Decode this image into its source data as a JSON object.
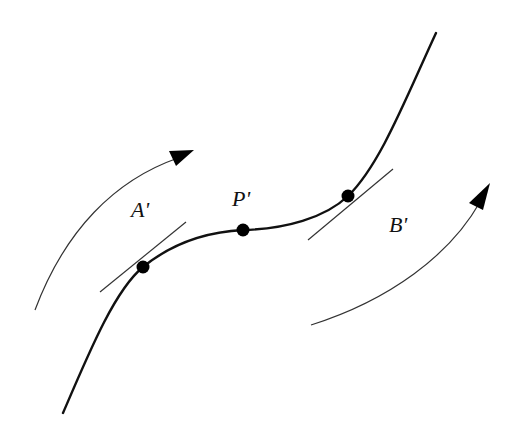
{
  "diagram": {
    "type": "curve-with-tangents",
    "colors": {
      "background": "#ffffff",
      "curve": "#111111",
      "tangent": "#333333",
      "arc": "#333333",
      "point": "#000000"
    },
    "points": [
      {
        "id": "A",
        "label": "A'",
        "x": 143,
        "y": 267
      },
      {
        "id": "P",
        "label": "P'",
        "x": 243,
        "y": 230
      },
      {
        "id": "B",
        "label": "B'",
        "x": 348,
        "y": 196
      }
    ],
    "labels": {
      "a": "A'",
      "p": "P'",
      "b": "B'"
    },
    "tangents": [
      {
        "at": "A'",
        "from": [
          100,
          292
        ],
        "to": [
          186,
          222
        ]
      },
      {
        "at": "B'",
        "from": [
          308,
          240
        ],
        "to": [
          393,
          169
        ]
      }
    ],
    "arrows": [
      {
        "name": "left-rotation-arrow",
        "from": [
          35,
          310
        ],
        "to": [
          194,
          150
        ],
        "direction": "up-right"
      },
      {
        "name": "right-rotation-arrow",
        "from": [
          311,
          325
        ],
        "to": [
          490,
          183
        ],
        "direction": "up-right"
      }
    ]
  }
}
